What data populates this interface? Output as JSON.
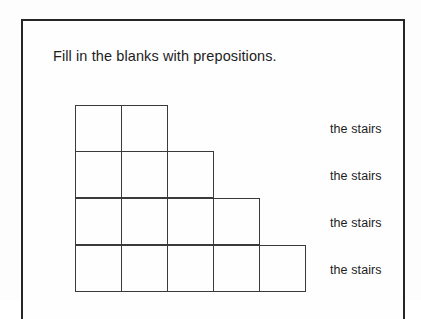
{
  "page": {
    "background_color": "#fdfdfd",
    "border_color": "#262626"
  },
  "worksheet": {
    "instruction": "Fill in the blanks with prepositions.",
    "diagram": {
      "name": "staircase",
      "line_color": "#3a3a3a",
      "cell_size_px": 47,
      "rows": [
        {
          "index": 0,
          "cell_count": 2
        },
        {
          "index": 1,
          "cell_count": 3
        },
        {
          "index": 2,
          "cell_count": 4
        },
        {
          "index": 3,
          "cell_count": 5
        }
      ]
    },
    "answer_lines": [
      {
        "index": 0,
        "label": "the stairs"
      },
      {
        "index": 1,
        "label": "the stairs"
      },
      {
        "index": 2,
        "label": "the stairs"
      },
      {
        "index": 3,
        "label": "the stairs"
      }
    ]
  }
}
